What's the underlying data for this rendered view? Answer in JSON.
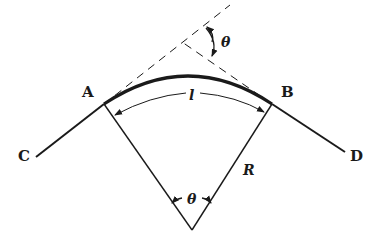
{
  "diagram": {
    "type": "circular-curve-geometry",
    "colors": {
      "line": "#1a1a1a",
      "background": "#ffffff"
    },
    "points": {
      "A": "A",
      "B": "B",
      "C": "C",
      "D": "D"
    },
    "labels": {
      "arc_length": "l",
      "radius": "R",
      "deflection_angle": "θ",
      "central_angle": "θ"
    }
  }
}
